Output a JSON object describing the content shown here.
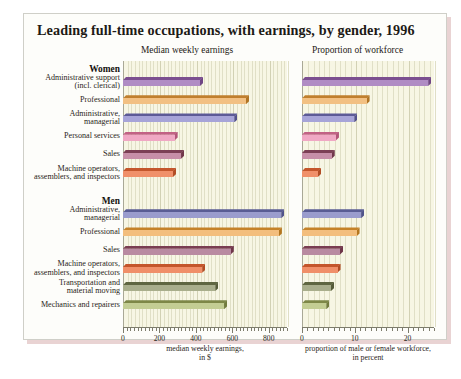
{
  "chart_data": {
    "type": "bar",
    "title": "Leading full-time occupations, with earnings, by gender, 1996",
    "panels": [
      {
        "id": "earnings",
        "header": "Median weekly earnings",
        "xlabel": "median weekly earnings,\nin $",
        "xlabel_line1": "median weekly earnings,",
        "xlabel_line2": "in $",
        "xlim": [
          0,
          900
        ],
        "ticks": [
          0,
          200,
          400,
          600,
          800
        ],
        "ticklabels": [
          "0",
          "200",
          "400",
          "600",
          "800"
        ],
        "minor_tick_step": 20,
        "grid": true
      },
      {
        "id": "workforce",
        "header": "Proportion of  workforce",
        "xlabel_line1": "proportion of male or female workforce,",
        "xlabel_line2": "in percent",
        "xlim": [
          0,
          25
        ],
        "ticks": [
          0,
          10,
          20
        ],
        "ticklabels": [
          "0",
          "10",
          "20"
        ],
        "minor_tick_step": 1,
        "grid": true
      }
    ],
    "groups": [
      {
        "name": "Women",
        "rows": [
          {
            "label_line1": "Administrative support",
            "label_line2": "(incl. clerical)",
            "earnings": 440,
            "workforce": 24.5,
            "color": "#b08cc4",
            "top": "#7b4f90",
            "side": "#6f4584"
          },
          {
            "label_line1": "Professional",
            "label_line2": "",
            "earnings": 692,
            "workforce": 12.8,
            "color": "#f2c083",
            "top": "#c07f2e",
            "side": "#b07424"
          },
          {
            "label_line1": "Administrative,",
            "label_line2": "managerial",
            "earnings": 628,
            "workforce": 10.5,
            "color": "#a7a4d8",
            "top": "#5d5a97",
            "side": "#52508b"
          },
          {
            "label_line1": "Personal services",
            "label_line2": "",
            "earnings": 300,
            "workforce": 7.0,
            "color": "#f0a8c4",
            "top": "#c26185",
            "side": "#b3567a"
          },
          {
            "label_line1": "Sales",
            "label_line2": "",
            "earnings": 336,
            "workforce": 6.2,
            "color": "#c78fa8",
            "top": "#7c3f55",
            "side": "#71374b"
          },
          {
            "label_line1": "Machine operators,",
            "label_line2": "assemblers, and inspectors",
            "earnings": 292,
            "workforce": 3.6,
            "color": "#f0906a",
            "top": "#c4562c",
            "side": "#b24d25"
          }
        ]
      },
      {
        "name": "Men",
        "rows": [
          {
            "label_line1": "Administrative,",
            "label_line2": "managerial",
            "earnings": 886,
            "workforce": 11.8,
            "color": "#9a9ccd",
            "top": "#5a5d94",
            "side": "#50538a"
          },
          {
            "label_line1": "Professional",
            "label_line2": "",
            "earnings": 872,
            "workforce": 10.9,
            "color": "#f3be7d",
            "top": "#c58229",
            "side": "#b4761f"
          },
          {
            "label_line1": "Sales",
            "label_line2": "",
            "earnings": 608,
            "workforce": 7.8,
            "color": "#b98aa1",
            "top": "#7a3d52",
            "side": "#6e3549"
          },
          {
            "label_line1": "Machine operators,",
            "label_line2": "assemblers, and inspectors",
            "earnings": 452,
            "workforce": 7.3,
            "color": "#f08f69",
            "top": "#c4552b",
            "side": "#b24c24"
          },
          {
            "label_line1": "Transportation and",
            "label_line2": "material moving",
            "earnings": 524,
            "workforce": 6.1,
            "color": "#a9ae8c",
            "top": "#5f6641",
            "side": "#555b39"
          },
          {
            "label_line1": "Mechanics and repairers",
            "label_line2": "",
            "earnings": 572,
            "workforce": 5.2,
            "color": "#c3cd93",
            "top": "#7d8747",
            "side": "#717b3d"
          }
        ]
      }
    ]
  }
}
